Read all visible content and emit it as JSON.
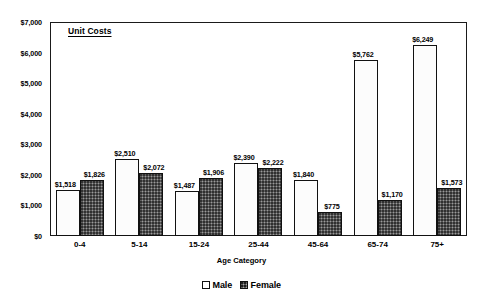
{
  "chart_data": {
    "type": "bar",
    "title": "Unit Costs",
    "xlabel": "Age Category",
    "ylabel": "",
    "ylim": [
      0,
      7000
    ],
    "ytick_step": 1000,
    "ytick_labels": [
      "$0",
      "$1,000",
      "$2,000",
      "$3,000",
      "$4,000",
      "$5,000",
      "$6,000",
      "$7,000"
    ],
    "ytick_values": [
      0,
      1000,
      2000,
      3000,
      4000,
      5000,
      6000,
      7000
    ],
    "grid": false,
    "legend_position": "bottom",
    "categories": [
      "0-4",
      "5-14",
      "15-24",
      "25-44",
      "45-64",
      "65-74",
      "75+"
    ],
    "series": [
      {
        "name": "Male",
        "values": [
          1518,
          2510,
          1487,
          2390,
          1840,
          5762,
          6249
        ],
        "labels": [
          "$1,518",
          "$2,510",
          "$1,487",
          "$2,390",
          "$1,840",
          "$5,762",
          "$6,249"
        ],
        "color": "#fcfcfc"
      },
      {
        "name": "Female",
        "values": [
          1826,
          2072,
          1906,
          2222,
          775,
          1170,
          1573
        ],
        "labels": [
          "$1,826",
          "$2,072",
          "$1,906",
          "$2,222",
          "$775",
          "$1,170",
          "$1,573"
        ],
        "color": "#5e5e5e"
      }
    ]
  },
  "legend": {
    "items": [
      {
        "label": "Male",
        "swatch": "male"
      },
      {
        "label": "Female",
        "swatch": "female"
      }
    ]
  }
}
